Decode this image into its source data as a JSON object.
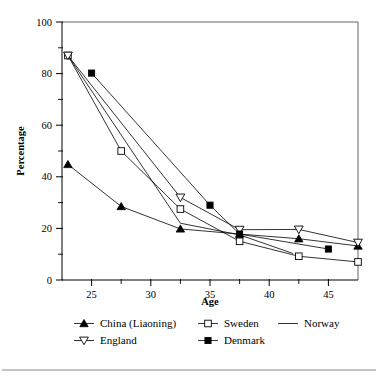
{
  "chart_data": {
    "type": "line",
    "title": "",
    "xlabel": "Age",
    "ylabel": "Percentage",
    "xlim": [
      22.5,
      47.5
    ],
    "ylim": [
      0,
      100
    ],
    "grid": false,
    "legend_position": "bottom",
    "x_ticks": [
      25,
      30,
      35,
      40,
      45
    ],
    "x_tick_labels": [
      "25",
      "30",
      "35",
      "40",
      "45"
    ],
    "x_minor_ticks": [
      27.5,
      32.5,
      37.5,
      42.5
    ],
    "y_ticks": [
      0,
      20,
      40,
      60,
      80,
      100
    ],
    "y_tick_labels": [
      "0",
      "20",
      "40",
      "60",
      "80",
      "100"
    ],
    "y_minor_ticks": [
      10,
      30,
      50,
      70,
      90
    ],
    "series": [
      {
        "name": "China (Liaoning)",
        "marker": "filled-triangle-up",
        "x": [
          23,
          27.5,
          32.5,
          37.5,
          42.5,
          47.5
        ],
        "values": [
          44.8,
          28.5,
          19.8,
          17.8,
          16.0,
          13.2
        ]
      },
      {
        "name": "Sweden",
        "marker": "open-square",
        "x": [
          23,
          27.5,
          32.5,
          37.5,
          42.5,
          47.5
        ],
        "values": [
          87.0,
          50.0,
          27.5,
          15.0,
          9.2,
          7.0
        ]
      },
      {
        "name": "Norway",
        "marker": "none",
        "x": [
          23,
          32.5,
          37.5,
          42.0
        ],
        "values": [
          87.0,
          22.0,
          17.5,
          10.3
        ]
      },
      {
        "name": "England",
        "marker": "open-triangle-down",
        "x": [
          23,
          32.5,
          37.5,
          42.5,
          47.5
        ],
        "values": [
          87.0,
          32.0,
          19.5,
          19.6,
          14.5
        ]
      },
      {
        "name": "Denmark",
        "marker": "filled-square",
        "x": [
          25,
          35,
          37.5,
          45
        ],
        "values": [
          80.2,
          29.0,
          17.8,
          12.0
        ]
      }
    ]
  },
  "axes": {
    "x_title": "Age",
    "y_title": "Percentage"
  },
  "legend": {
    "entries": [
      {
        "label": "China (Liaoning)",
        "marker": "filled-triangle-up"
      },
      {
        "label": "Sweden",
        "marker": "open-square"
      },
      {
        "label": "Norway",
        "marker": "none"
      },
      {
        "label": "England",
        "marker": "open-triangle-down"
      },
      {
        "label": "Denmark",
        "marker": "filled-square"
      }
    ]
  },
  "colors": {
    "ink": "#000000",
    "frame": "#555555",
    "rule": "#8a8a8a",
    "background": "#ffffff"
  }
}
